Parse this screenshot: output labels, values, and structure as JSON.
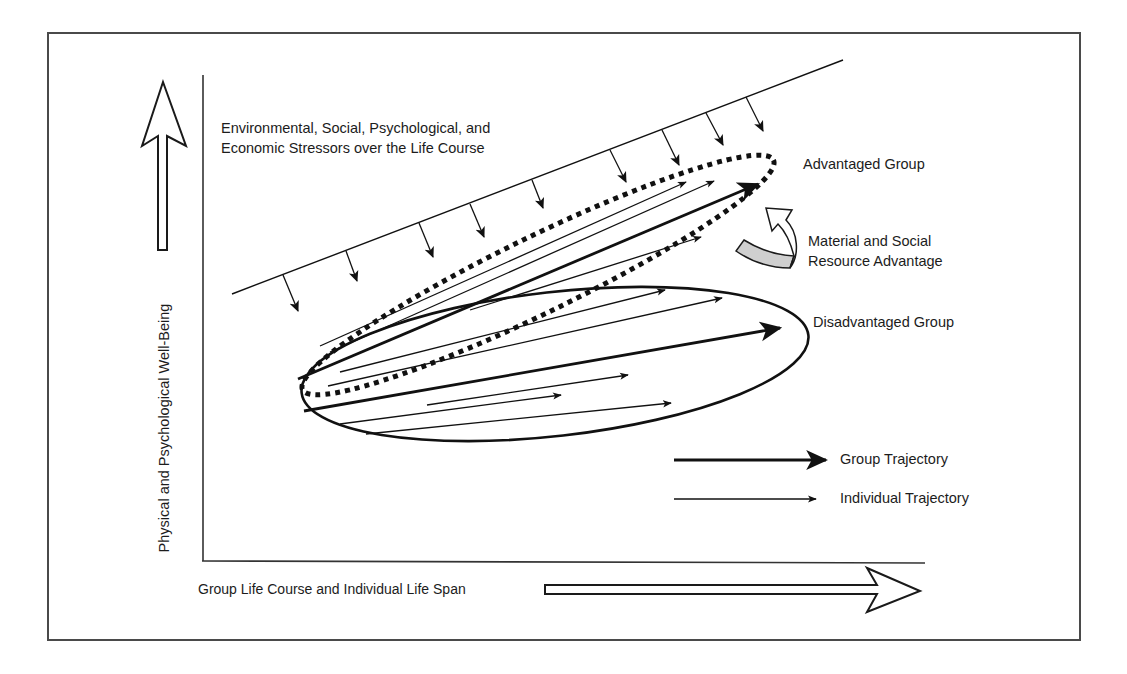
{
  "figure": {
    "y_axis_label": "Physical and Psychological Well-Being",
    "x_axis_label": "Group Life Course and Individual Life Span",
    "stressors_label_line1": "Environmental, Social, Psychological, and",
    "stressors_label_line2": "Economic Stressors over the Life Course",
    "advantaged_group_label": "Advantaged Group",
    "disadvantaged_group_label": "Disadvantaged Group",
    "resource_label_line1": "Material and Social",
    "resource_label_line2": "Resource Advantage",
    "legend": {
      "group_trajectory": "Group Trajectory",
      "individual_trajectory": "Individual Trajectory"
    }
  },
  "colors": {
    "stroke": "#111111",
    "frame": "#4a4a4a",
    "resource_band_fill": "#cfcfcf",
    "background": "#ffffff"
  },
  "groups": [
    {
      "name": "Advantaged Group",
      "outline": "dotted",
      "group_trajectory_count": 1,
      "individual_trajectory_count": 3
    },
    {
      "name": "Disadvantaged Group",
      "outline": "solid",
      "group_trajectory_count": 1,
      "individual_trajectory_count": 5
    }
  ],
  "stressor_arrow_count": 9
}
